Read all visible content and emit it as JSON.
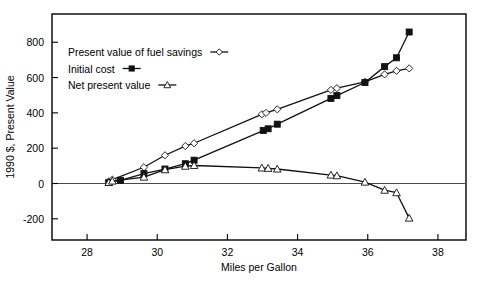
{
  "chart_data": {
    "type": "line",
    "title": "",
    "xlabel": "Miles per Gallon",
    "ylabel": "1990 $, Present Value",
    "xlim": [
      27.0,
      38.8
    ],
    "ylim": [
      -320,
      960
    ],
    "xticks": [
      28,
      30,
      32,
      34,
      36,
      38
    ],
    "yticks": [
      -200,
      0,
      200,
      400,
      600,
      800
    ],
    "xtick_labels": [
      "28",
      "30",
      "32",
      "34",
      "36",
      "38"
    ],
    "ytick_labels": [
      "-200",
      "0",
      "200",
      "400",
      "600",
      "800"
    ],
    "grid": false,
    "zero_line": true,
    "legend_position": "upper-left-inside",
    "series": [
      {
        "name": "Present value of fuel savings",
        "marker": "open-diamond",
        "line": "solid",
        "points": [
          {
            "x": 28.62,
            "y": 12
          },
          {
            "x": 28.72,
            "y": 22
          },
          {
            "x": 29.62,
            "y": 92
          },
          {
            "x": 30.22,
            "y": 160
          },
          {
            "x": 30.8,
            "y": 212
          },
          {
            "x": 31.05,
            "y": 228
          },
          {
            "x": 32.98,
            "y": 392
          },
          {
            "x": 33.1,
            "y": 400
          },
          {
            "x": 33.42,
            "y": 420
          },
          {
            "x": 34.95,
            "y": 530
          },
          {
            "x": 35.12,
            "y": 540
          },
          {
            "x": 35.92,
            "y": 576
          },
          {
            "x": 36.48,
            "y": 618
          },
          {
            "x": 36.82,
            "y": 638
          },
          {
            "x": 37.18,
            "y": 652
          }
        ]
      },
      {
        "name": "Initial cost",
        "marker": "filled-square",
        "line": "solid",
        "points": [
          {
            "x": 28.62,
            "y": 6
          },
          {
            "x": 28.95,
            "y": 18
          },
          {
            "x": 29.62,
            "y": 56
          },
          {
            "x": 30.22,
            "y": 82
          },
          {
            "x": 30.8,
            "y": 112
          },
          {
            "x": 31.05,
            "y": 132
          },
          {
            "x": 33.02,
            "y": 300
          },
          {
            "x": 33.16,
            "y": 310
          },
          {
            "x": 33.42,
            "y": 336
          },
          {
            "x": 34.95,
            "y": 482
          },
          {
            "x": 35.12,
            "y": 498
          },
          {
            "x": 35.92,
            "y": 572
          },
          {
            "x": 36.48,
            "y": 662
          },
          {
            "x": 36.82,
            "y": 712
          },
          {
            "x": 37.18,
            "y": 858
          }
        ]
      },
      {
        "name": "Net present value",
        "marker": "open-triangle",
        "line": "solid",
        "points": [
          {
            "x": 28.62,
            "y": 6
          },
          {
            "x": 28.72,
            "y": 14
          },
          {
            "x": 29.62,
            "y": 36
          },
          {
            "x": 30.22,
            "y": 78
          },
          {
            "x": 30.8,
            "y": 98
          },
          {
            "x": 31.05,
            "y": 102
          },
          {
            "x": 32.98,
            "y": 88
          },
          {
            "x": 33.16,
            "y": 86
          },
          {
            "x": 33.42,
            "y": 82
          },
          {
            "x": 34.95,
            "y": 48
          },
          {
            "x": 35.12,
            "y": 44
          },
          {
            "x": 35.92,
            "y": 8
          },
          {
            "x": 36.48,
            "y": -38
          },
          {
            "x": 36.82,
            "y": -52
          },
          {
            "x": 37.18,
            "y": -196
          }
        ]
      }
    ]
  },
  "legend": {
    "items": [
      {
        "label": "Present value of fuel savings",
        "marker": "open-diamond"
      },
      {
        "label": "Initial cost",
        "marker": "filled-square"
      },
      {
        "label": "Net present value",
        "marker": "open-triangle"
      }
    ]
  },
  "colors": {
    "ink": "#111111",
    "axis": "#000000",
    "zero_line": "#4a4a4a",
    "background": "#ffffff"
  }
}
